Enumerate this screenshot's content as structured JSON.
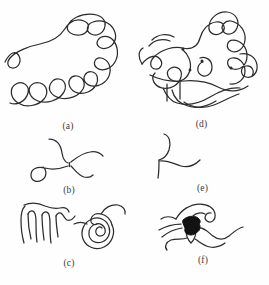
{
  "figure": {
    "background_color": "#fefefe",
    "ink_color": "#2c2c2c",
    "fill_color": "#121212",
    "width": 269,
    "height": 285,
    "panels": [
      {
        "id": "a",
        "label": "(a)",
        "description": "long meandering open curve, dense self-overlapping random coil",
        "curve_type": "open-chain",
        "has_filled_region": false
      },
      {
        "id": "d",
        "label": "(d)",
        "description": "long meandering curve with several crossing junctions and small closed loops",
        "curve_type": "open-chain-with-crossings",
        "has_filled_region": false
      },
      {
        "id": "b",
        "label": "(b)",
        "description": "four curved arms meeting at a short vertical connector, X junction",
        "curve_type": "four-arm-junction",
        "has_filled_region": false
      },
      {
        "id": "e",
        "label": "(e)",
        "description": "shallow S curve with a vertical branch dropping from the junction",
        "curve_type": "three-arm-branch",
        "has_filled_region": false
      },
      {
        "id": "c",
        "label": "(c)",
        "description": "zigzag comb of folded hairpins on the left and a tight spiral with a trailing tail on the right",
        "curve_type": "hairpin-comb-and-spiral",
        "has_filled_region": false
      },
      {
        "id": "f",
        "label": "(f)",
        "description": "branched curve with a solid black filled blob at the central junction",
        "curve_type": "branched-with-solid-node",
        "has_filled_region": true
      }
    ]
  }
}
